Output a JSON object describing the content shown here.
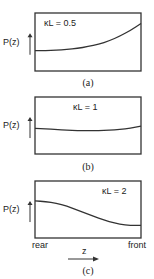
{
  "chart_data": [
    {
      "type": "line",
      "panel": "(a)",
      "ylabel": "P(z)",
      "annotation": "κL = 0.5",
      "x": [
        0,
        0.1,
        0.2,
        0.3,
        0.4,
        0.5,
        0.6,
        0.7,
        0.8,
        0.9,
        1.0
      ],
      "values": [
        0.35,
        0.35,
        0.36,
        0.37,
        0.39,
        0.42,
        0.46,
        0.52,
        0.6,
        0.7,
        0.82
      ],
      "ylim": [
        0,
        1
      ]
    },
    {
      "type": "line",
      "panel": "(b)",
      "ylabel": "P(z)",
      "annotation": "κL = 1",
      "x": [
        0,
        0.1,
        0.2,
        0.3,
        0.4,
        0.5,
        0.6,
        0.7,
        0.8,
        0.9,
        1.0
      ],
      "values": [
        0.45,
        0.44,
        0.43,
        0.42,
        0.41,
        0.41,
        0.41,
        0.42,
        0.43,
        0.45,
        0.49
      ],
      "ylim": [
        0,
        1
      ]
    },
    {
      "type": "line",
      "panel": "(c)",
      "ylabel": "P(z)",
      "annotation": "κL = 2",
      "xlabel": "z",
      "xstart_label": "rear",
      "xend_label": "front",
      "x": [
        0,
        0.1,
        0.2,
        0.3,
        0.4,
        0.5,
        0.6,
        0.7,
        0.8,
        0.9,
        1.0
      ],
      "values": [
        0.65,
        0.64,
        0.61,
        0.56,
        0.49,
        0.42,
        0.35,
        0.29,
        0.24,
        0.22,
        0.22
      ],
      "ylim": [
        0,
        1
      ]
    }
  ]
}
